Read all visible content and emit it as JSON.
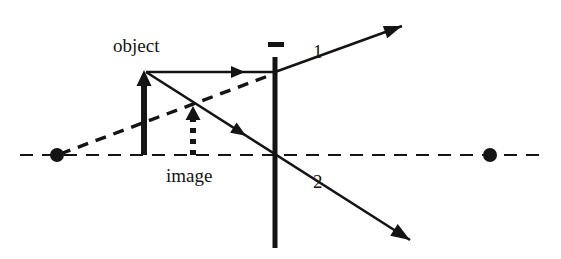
{
  "figure": {
    "type": "optics-ray-diagram",
    "width": 561,
    "height": 259,
    "background_color": "#ffffff",
    "stroke_color": "#141414"
  },
  "labels": {
    "object": "object",
    "image": "image",
    "ray_one": "1",
    "ray_two": "2",
    "lens_sign": "−"
  },
  "diagram_data": {
    "optical_axis": {
      "name": "optical-axis",
      "style": "dashed",
      "y": 155,
      "x_start": 20,
      "x_end": 545,
      "dash": "13 9",
      "stroke_width": 2.2,
      "color": "#141414"
    },
    "lens": {
      "name": "diverging-lens",
      "type": "diverging",
      "x": 275,
      "y_top": 57,
      "y_bottom": 248,
      "stroke_width": 5,
      "color": "#141414",
      "sign_mark": {
        "label": "−",
        "x": 268,
        "y": 42,
        "width": 16,
        "height": 5
      }
    },
    "focal_points": [
      {
        "name": "focal-point-left",
        "x": 57,
        "y": 155,
        "radius": 7,
        "color": "#141414"
      },
      {
        "name": "focal-point-right",
        "x": 490,
        "y": 155,
        "radius": 7,
        "color": "#141414"
      }
    ],
    "object_arrow": {
      "name": "object-arrow",
      "x": 144,
      "y_base": 155,
      "y_tip": 70,
      "style": "solid",
      "stroke_width": 6,
      "head_width": 15,
      "head_length": 16,
      "color": "#141414"
    },
    "image_arrow": {
      "name": "image-arrow",
      "x": 193,
      "y_base": 155,
      "y_tip": 106,
      "style": "dotted",
      "stroke_width": 6,
      "dash": "5 6",
      "head_width": 15,
      "head_length": 14,
      "color": "#141414"
    },
    "rays": [
      {
        "name": "incident-parallel-ray",
        "style": "solid",
        "stroke_width": 2.6,
        "x1": 146,
        "y1": 72,
        "x2": 275,
        "y2": 72,
        "mid_arrow_at": 245,
        "color": "#141414"
      },
      {
        "name": "refracted-ray-1",
        "label": "1",
        "style": "solid",
        "stroke_width": 2.6,
        "x1": 275,
        "y1": 72,
        "x2": 402,
        "y2": 26,
        "color": "#141414"
      },
      {
        "name": "chief-ray-2",
        "label": "2",
        "style": "solid",
        "stroke_width": 2.6,
        "x1": 146,
        "y1": 72,
        "x2": 410,
        "y2": 240,
        "mid_arrow_at_x": 246,
        "color": "#141414"
      },
      {
        "name": "virtual-ray-extension",
        "style": "dashed",
        "stroke_width": 3.4,
        "dash": "11 8",
        "x1": 60,
        "y1": 154,
        "x2": 276,
        "y2": 73,
        "color": "#141414"
      }
    ]
  }
}
